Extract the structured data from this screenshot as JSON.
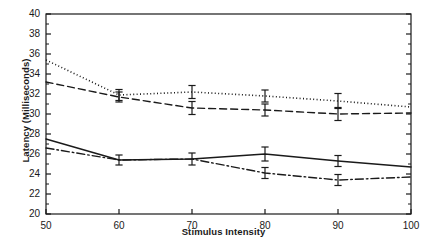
{
  "chart_data": {
    "type": "line",
    "title": "",
    "xlabel": "Stimulus Intensity",
    "ylabel": "Latency (Milliseconds)",
    "x": [
      50,
      60,
      70,
      80,
      90,
      100
    ],
    "xlim": [
      50,
      100
    ],
    "ylim": [
      20,
      40
    ],
    "xticks": [
      50,
      60,
      70,
      80,
      90,
      100
    ],
    "yticks": [
      20,
      22,
      24,
      26,
      28,
      30,
      32,
      34,
      36,
      38,
      40
    ],
    "y_minor_ticks": [
      21,
      23,
      25,
      27,
      29,
      31,
      33,
      35,
      37,
      39
    ],
    "grid": false,
    "legend": "none",
    "series": [
      {
        "name": "series-dotted",
        "style": "dotted",
        "color": "#1a1a1a",
        "values": [
          35.4,
          31.9,
          32.2,
          31.8,
          31.3,
          30.7
        ],
        "errors": [
          0.0,
          0.55,
          0.65,
          0.6,
          0.75,
          0.0
        ]
      },
      {
        "name": "series-dashed",
        "style": "dashed",
        "color": "#1a1a1a",
        "values": [
          33.2,
          31.7,
          30.6,
          30.4,
          30.0,
          30.1
        ],
        "errors": [
          0.0,
          0.5,
          0.65,
          0.6,
          0.65,
          0.0
        ]
      },
      {
        "name": "series-solid",
        "style": "solid",
        "color": "#1a1a1a",
        "values": [
          27.5,
          25.4,
          25.5,
          26.0,
          25.3,
          24.7
        ],
        "errors": [
          0.0,
          0.5,
          0.6,
          0.7,
          0.55,
          0.0
        ]
      },
      {
        "name": "series-dash-dot",
        "style": "dash-dot",
        "color": "#1a1a1a",
        "values": [
          26.6,
          25.4,
          25.5,
          24.1,
          23.4,
          23.7
        ],
        "errors": [
          0.0,
          0.0,
          0.0,
          0.55,
          0.55,
          0.0
        ]
      }
    ]
  },
  "axes": {
    "frame_color": "#1a1a1a"
  }
}
